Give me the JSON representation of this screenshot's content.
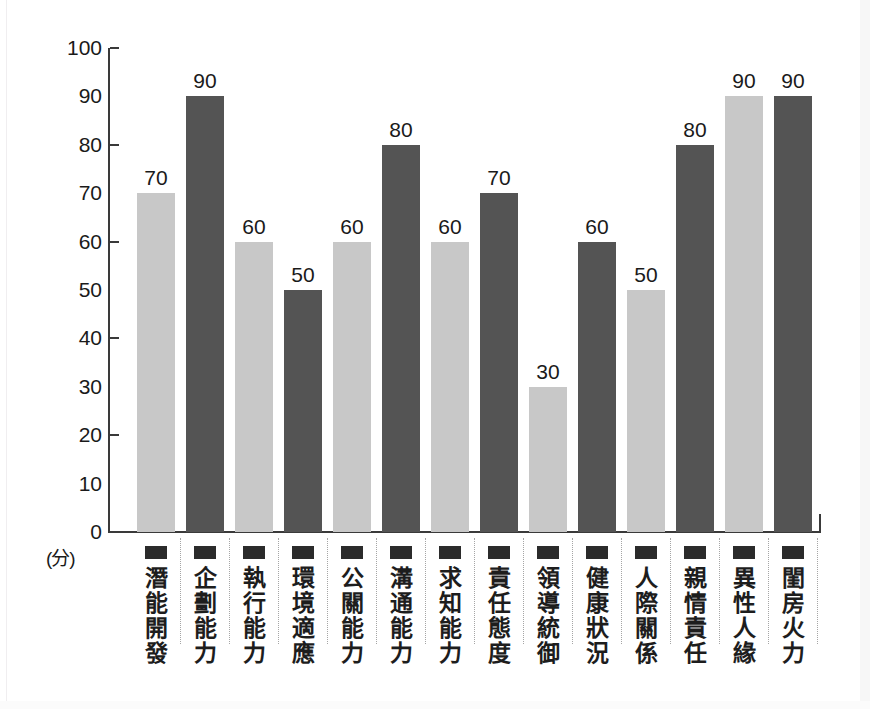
{
  "chart_data": {
    "type": "bar",
    "title": "",
    "subtitle": "",
    "xlabel": "",
    "ylabel": "(分)",
    "ylim": [
      0,
      100
    ],
    "grid": false,
    "legend": null,
    "y_ticks": [
      0,
      10,
      20,
      30,
      40,
      50,
      60,
      70,
      80,
      90,
      100
    ],
    "y_major_ticks": [
      0,
      20,
      40,
      60,
      80,
      100
    ],
    "categories": [
      "潛能開發",
      "企劃能力",
      "執行能力",
      "環境適應",
      "公關能力",
      "溝通能力",
      "求知能力",
      "責任態度",
      "領導統御",
      "健康狀況",
      "人際關係",
      "親情責任",
      "異性人緣",
      "閨房火力"
    ],
    "values": [
      70,
      90,
      60,
      50,
      60,
      80,
      60,
      70,
      30,
      60,
      50,
      80,
      90,
      90
    ],
    "bar_colors": [
      "#c8c8c8",
      "#545454",
      "#c8c8c8",
      "#545454",
      "#c8c8c8",
      "#545454",
      "#c8c8c8",
      "#545454",
      "#c8c8c8",
      "#545454",
      "#c8c8c8",
      "#545454",
      "#c8c8c8",
      "#545454"
    ],
    "value_labels": [
      "70",
      "90",
      "60",
      "50",
      "60",
      "80",
      "60",
      "70",
      "30",
      "60",
      "50",
      "80",
      "90",
      "90"
    ]
  },
  "axis": {
    "unit_label": "(分)",
    "tick_labels": [
      "100",
      "90",
      "80",
      "70",
      "60",
      "50",
      "40",
      "30",
      "20",
      "10",
      "0"
    ]
  },
  "colors": {
    "bar_light": "#c8c8c8",
    "bar_dark": "#545454",
    "axis": "#3a3a3a",
    "text": "#1a1a1a",
    "separator": "#a5a5a5",
    "marker": "#2b2b2b",
    "background": "#ffffff"
  }
}
